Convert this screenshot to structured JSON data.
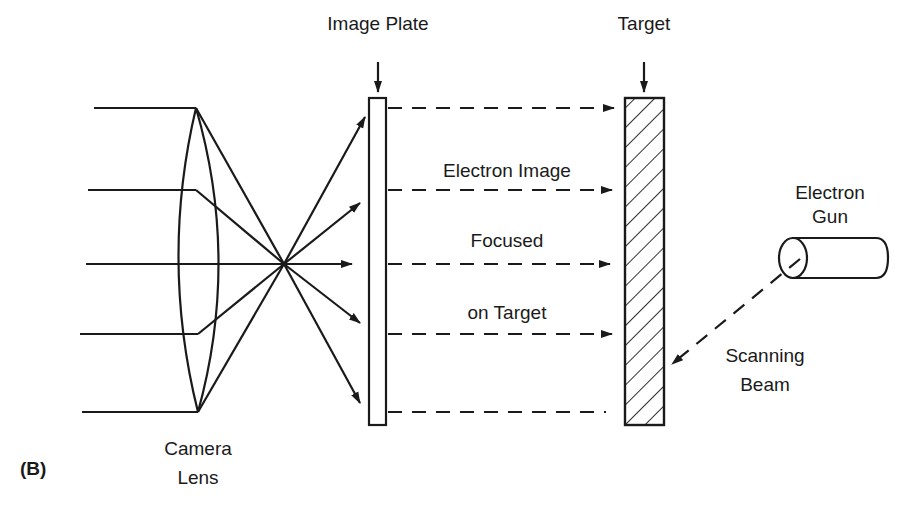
{
  "figure": {
    "panel_label": "(B)",
    "labels": {
      "image_plate": "Image Plate",
      "target": "Target",
      "electron_image": "Electron Image",
      "focused": "Focused",
      "on_target": "on Target",
      "electron_gun_line1": "Electron",
      "electron_gun_line2": "Gun",
      "scanning_line1": "Scanning",
      "scanning_line2": "Beam",
      "camera_line1": "Camera",
      "camera_line2": "Lens"
    },
    "components": [
      "camera-lens",
      "image-plate",
      "target",
      "electron-gun"
    ],
    "colors": {
      "ink": "#1a1a1a",
      "background": "#ffffff"
    }
  }
}
